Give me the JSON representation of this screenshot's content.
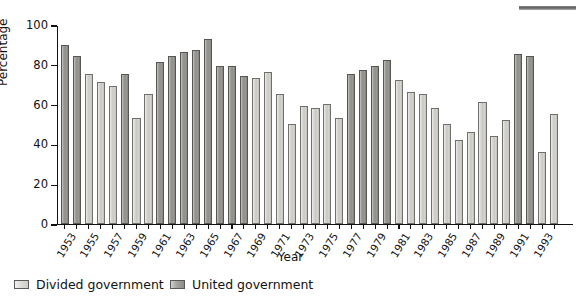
{
  "chart_data": {
    "type": "bar",
    "title": "",
    "xlabel": "Year",
    "ylabel": "Percentage",
    "ylim": [
      0,
      100
    ],
    "ytick_values": [
      0,
      20,
      40,
      60,
      80,
      100
    ],
    "ytick_labels": [
      "0",
      "20",
      "40",
      "60",
      "80",
      "100"
    ],
    "grid": false,
    "legend_position": "bottom-left",
    "categories": [
      "1953",
      "1954",
      "1955",
      "1956",
      "1957",
      "1958",
      "1959",
      "1960",
      "1961",
      "1962",
      "1963",
      "1964",
      "1965",
      "1966",
      "1967",
      "1968",
      "1969",
      "1970",
      "1971",
      "1972",
      "1973",
      "1974",
      "1975",
      "1976",
      "1977",
      "1978",
      "1979",
      "1980",
      "1981",
      "1982",
      "1983",
      "1984",
      "1985",
      "1986",
      "1987",
      "1988",
      "1989",
      "1990",
      "1991",
      "1992",
      "1993",
      "1994",
      "1995",
      "1996"
    ],
    "xtick_labels": [
      "1953",
      "1955",
      "1957",
      "1959",
      "1961",
      "1963",
      "1965",
      "1967",
      "1969",
      "1971",
      "1973",
      "1975",
      "1977",
      "1979",
      "1981",
      "1983",
      "1985",
      "1987",
      "1989",
      "1991",
      "1993",
      "1995"
    ],
    "values": [
      90,
      84,
      75,
      71,
      69,
      75,
      53,
      65,
      81,
      84,
      86,
      87,
      93,
      79,
      79,
      74,
      73,
      76,
      65,
      50,
      59,
      58,
      60,
      53,
      75,
      77,
      79,
      82,
      72,
      66,
      65,
      58,
      50,
      42,
      46,
      61,
      44,
      52,
      85,
      84,
      36,
      55,
      0,
      0
    ],
    "series": [
      {
        "name": "Divided government",
        "color": "#d4d3ce",
        "years": [
          "1955",
          "1956",
          "1957",
          "1959",
          "1969",
          "1970",
          "1971",
          "1972",
          "1973",
          "1974",
          "1975",
          "1976",
          "1981",
          "1982",
          "1983",
          "1984",
          "1985",
          "1986",
          "1987",
          "1988",
          "1989",
          "1990",
          "1991",
          "1992",
          "1995",
          "1996"
        ]
      },
      {
        "name": "United government",
        "color": "#92918d",
        "years": [
          "1953",
          "1954",
          "1958",
          "1961",
          "1962",
          "1963",
          "1964",
          "1965",
          "1966",
          "1967",
          "1968",
          "1977",
          "1978",
          "1979",
          "1980",
          "1993",
          "1994"
        ]
      }
    ],
    "points": [
      {
        "year": "1953",
        "value": 90,
        "group": "united"
      },
      {
        "year": "1954",
        "value": 84,
        "group": "united"
      },
      {
        "year": "1955",
        "value": 75,
        "group": "divided"
      },
      {
        "year": "1956",
        "value": 71,
        "group": "divided"
      },
      {
        "year": "1957",
        "value": 69,
        "group": "divided"
      },
      {
        "year": "1958",
        "value": 75,
        "group": "united"
      },
      {
        "year": "1959",
        "value": 53,
        "group": "divided"
      },
      {
        "year": "1960",
        "value": 65,
        "group": "divided"
      },
      {
        "year": "1961",
        "value": 81,
        "group": "united"
      },
      {
        "year": "1962",
        "value": 84,
        "group": "united"
      },
      {
        "year": "1963",
        "value": 86,
        "group": "united"
      },
      {
        "year": "1964",
        "value": 87,
        "group": "united"
      },
      {
        "year": "1965",
        "value": 93,
        "group": "united"
      },
      {
        "year": "1966",
        "value": 79,
        "group": "united"
      },
      {
        "year": "1967",
        "value": 79,
        "group": "united"
      },
      {
        "year": "1968",
        "value": 74,
        "group": "united"
      },
      {
        "year": "1969",
        "value": 73,
        "group": "divided"
      },
      {
        "year": "1970",
        "value": 76,
        "group": "divided"
      },
      {
        "year": "1971",
        "value": 65,
        "group": "divided"
      },
      {
        "year": "1972",
        "value": 50,
        "group": "divided"
      },
      {
        "year": "1973",
        "value": 59,
        "group": "divided"
      },
      {
        "year": "1974",
        "value": 58,
        "group": "divided"
      },
      {
        "year": "1975",
        "value": 60,
        "group": "divided"
      },
      {
        "year": "1976",
        "value": 53,
        "group": "divided"
      },
      {
        "year": "1977",
        "value": 75,
        "group": "united"
      },
      {
        "year": "1978",
        "value": 77,
        "group": "united"
      },
      {
        "year": "1979",
        "value": 79,
        "group": "united"
      },
      {
        "year": "1980",
        "value": 82,
        "group": "united"
      },
      {
        "year": "1981",
        "value": 72,
        "group": "divided"
      },
      {
        "year": "1982",
        "value": 66,
        "group": "divided"
      },
      {
        "year": "1983",
        "value": 65,
        "group": "divided"
      },
      {
        "year": "1984",
        "value": 58,
        "group": "divided"
      },
      {
        "year": "1985",
        "value": 50,
        "group": "divided"
      },
      {
        "year": "1986",
        "value": 42,
        "group": "divided"
      },
      {
        "year": "1987",
        "value": 46,
        "group": "divided"
      },
      {
        "year": "1988",
        "value": 61,
        "group": "divided"
      },
      {
        "year": "1989",
        "value": 44,
        "group": "divided"
      },
      {
        "year": "1990",
        "value": 52,
        "group": "divided"
      },
      {
        "year": "1991",
        "value": 85,
        "group": "united"
      },
      {
        "year": "1992",
        "value": 84,
        "group": "united"
      },
      {
        "year": "1993",
        "value": 36,
        "group": "divided"
      },
      {
        "year": "1994",
        "value": 55,
        "group": "divided"
      }
    ]
  },
  "legend": {
    "divided_label": "Divided government",
    "united_label": "United government"
  },
  "axes": {
    "y_title": "Percentage",
    "x_title": "Year"
  }
}
